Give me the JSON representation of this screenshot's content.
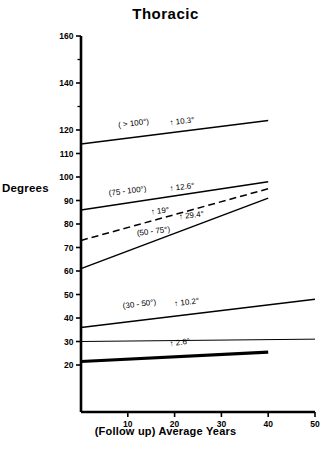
{
  "chart_data": {
    "type": "line",
    "title": "Thoracic",
    "xlabel": "(Follow up) Average Years",
    "ylabel": "Degrees",
    "xlim": [
      0,
      50
    ],
    "ylim": [
      20,
      160
    ],
    "grid": false,
    "legend": "none",
    "xticks": [
      10,
      20,
      30,
      40,
      50
    ],
    "xtick_labels": [
      "10",
      "20",
      "30",
      "40",
      "50"
    ],
    "yticks": [
      20,
      30,
      40,
      50,
      60,
      70,
      80,
      90,
      100,
      110,
      120,
      130,
      140,
      150,
      160
    ],
    "ytick_labels": [
      "20",
      "30",
      "40",
      "50",
      "60",
      "70",
      "80",
      "90",
      "100",
      "110",
      "120",
      "",
      "140",
      "",
      "160"
    ],
    "series": [
      {
        "name": "( > 100°)",
        "label": "( > 100°)",
        "increase_label": "↑ 10.3°",
        "style": "solid",
        "x": [
          0,
          40
        ],
        "values": [
          114,
          124
        ]
      },
      {
        "name": "(75 - 100°)",
        "label": "(75 - 100°)",
        "increase_label": "↑ 12.6°",
        "style": "solid",
        "x": [
          0,
          40
        ],
        "values": [
          86,
          98
        ]
      },
      {
        "name": "dashed-mean",
        "label": "",
        "increase_label": "↑ 19°",
        "style": "dashed",
        "x": [
          0,
          40
        ],
        "values": [
          73,
          95
        ]
      },
      {
        "name": "(50 - 75°)",
        "label": "(50 - 75°)",
        "increase_label": "↑ 29.4°",
        "style": "solid",
        "x": [
          0,
          40
        ],
        "values": [
          61,
          91
        ]
      },
      {
        "name": "(30 - 50°)",
        "label": "(30 - 50°)",
        "increase_label": "↑ 10.2°",
        "style": "solid",
        "x": [
          0,
          50
        ],
        "values": [
          36,
          48
        ]
      },
      {
        "name": "flat-reference",
        "label": "",
        "increase_label": "",
        "style": "solid-thin",
        "x": [
          0,
          50
        ],
        "values": [
          30,
          31
        ]
      },
      {
        "name": "lowest-group",
        "label": "",
        "increase_label": "↑ 2.6°",
        "style": "solid-thick",
        "x": [
          0,
          40
        ],
        "values": [
          21.5,
          25.5
        ]
      }
    ],
    "annotations": [
      {
        "text": "( > 100°)",
        "x": 8,
        "y": 121
      },
      {
        "text": "↑ 10.3°",
        "x": 19,
        "y": 122
      },
      {
        "text": "(75 - 100°)",
        "x": 6,
        "y": 92
      },
      {
        "text": "↑ 12.6°",
        "x": 19,
        "y": 94
      },
      {
        "text": "↑ 19°",
        "x": 15,
        "y": 84
      },
      {
        "text": "↑ 29.4°",
        "x": 21,
        "y": 82
      },
      {
        "text": "(50 - 75°)",
        "x": 12,
        "y": 75
      },
      {
        "text": "(30 - 50°)",
        "x": 9,
        "y": 44
      },
      {
        "text": "↑ 10.2°",
        "x": 20,
        "y": 45
      },
      {
        "text": "↑ 2.6°",
        "x": 19,
        "y": 28
      }
    ]
  },
  "axis_colors": {
    "axis": "#000000",
    "line": "#000000"
  }
}
